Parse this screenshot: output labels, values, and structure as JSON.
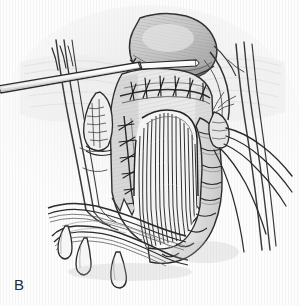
{
  "figure": {
    "panel_label": "B",
    "medium": "pen-and-ink line drawing with graphite shading",
    "background_color": "#fdfdfd",
    "ink_color": "#2b2b2b",
    "shading_color": "#9a9a9a",
    "paper_texture": "faint vertical striations"
  },
  "structures": [
    {
      "name": "pelvic-organ-dome",
      "label": "Rounded pelvic organ (dome)",
      "region": "top-center"
    },
    {
      "name": "ribbon-retractor",
      "label": "Flat ribbon retractor",
      "region": "upper-left to center"
    },
    {
      "name": "transverse-suture-line",
      "label": "Transverse interrupted anastomotic suture line",
      "region": "upper-center"
    },
    {
      "name": "vertical-suture-line",
      "label": "Vertical interrupted suture line",
      "region": "mid-left-center"
    },
    {
      "name": "bowel-lumen-striations",
      "label": "Opened bowel lumen with longitudinal mucosal striations",
      "region": "center"
    },
    {
      "name": "haustrated-colon",
      "label": "Haustrated colon wall",
      "region": "right-center to lower-center"
    },
    {
      "name": "sigmoid-loop",
      "label": "Sigmoid colon loop",
      "region": "lower-left"
    },
    {
      "name": "appendices-epiploicae",
      "label": "Appendices epiploicae (fatty tags)",
      "region": "bottom-left"
    },
    {
      "name": "mesenteric-vessels-right",
      "label": "Mesenteric vessels crossing obliquely",
      "region": "right"
    },
    {
      "name": "mesenteric-vessels-left",
      "label": "Mesenteric vessels",
      "region": "left"
    },
    {
      "name": "fimbriated-appendage",
      "label": "Fimbriated appendage / appendix epiploica",
      "region": "mid-left"
    },
    {
      "name": "vascular-pedicle-stump",
      "label": "Vascular pedicle stump",
      "region": "right-center"
    }
  ]
}
